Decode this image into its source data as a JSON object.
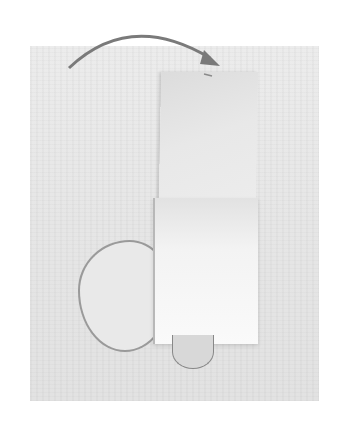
{
  "image": {
    "description": "Photo of a folded fabric strip with a loop, with a curved arrow indicating folding direction",
    "colors": {
      "background": "#ffffff",
      "photo": "#e8e8e8",
      "arrow": "#7a7a7a"
    }
  }
}
